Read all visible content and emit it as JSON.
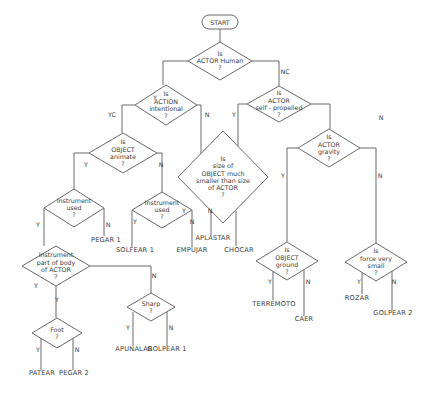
{
  "diagram": {
    "type": "decision-flowchart",
    "start": {
      "label": "START",
      "x": 220,
      "y": 22
    },
    "decisions": [
      {
        "id": "actor_human",
        "lines": [
          "Is",
          "ACTOR Human",
          "?"
        ],
        "cx": 220,
        "cy": 61,
        "hw": 32,
        "hh": 19
      },
      {
        "id": "action_intentional",
        "lines": [
          "Is",
          "ACTION",
          "intentional",
          "?"
        ],
        "cx": 166,
        "cy": 105,
        "hw": 31,
        "hh": 20
      },
      {
        "id": "actor_self_propelled",
        "lines": [
          "Is",
          "ACTOR",
          "self - propelled",
          "?"
        ],
        "cx": 279,
        "cy": 104,
        "hw": 32,
        "hh": 18
      },
      {
        "id": "object_animate",
        "lines": [
          "Is",
          "OBJECT",
          "animate",
          "?"
        ],
        "cx": 123,
        "cy": 153,
        "hw": 34,
        "hh": 20
      },
      {
        "id": "size_smaller",
        "lines": [
          "Is",
          "size of",
          "OBJECT much",
          "smaller than size",
          "of ACTOR",
          "?"
        ],
        "cx": 223,
        "cy": 177,
        "hw": 45,
        "hh": 46
      },
      {
        "id": "actor_gravity",
        "lines": [
          "Is",
          "ACTOR",
          "gravity",
          "?"
        ],
        "cx": 329,
        "cy": 148,
        "hw": 31,
        "hh": 19
      },
      {
        "id": "instrument_used_1",
        "lines": [
          "instrument",
          "used",
          "?"
        ],
        "cx": 74,
        "cy": 208,
        "hw": 30,
        "hh": 19
      },
      {
        "id": "instrument_used_2",
        "lines": [
          "instrument",
          "used",
          "?"
        ],
        "cx": 162,
        "cy": 210,
        "hw": 30,
        "hh": 18
      },
      {
        "id": "instrument_body",
        "lines": [
          "Instrument",
          "part of body",
          "of ACTOR",
          "?"
        ],
        "cx": 56,
        "cy": 266,
        "hw": 34,
        "hh": 20
      },
      {
        "id": "sharp",
        "lines": [
          "Sharp",
          "?"
        ],
        "cx": 151,
        "cy": 307,
        "hw": 24,
        "hh": 14
      },
      {
        "id": "foot",
        "lines": [
          "Foot",
          "?"
        ],
        "cx": 57,
        "cy": 333,
        "hw": 25,
        "hh": 15
      },
      {
        "id": "object_ground",
        "lines": [
          "Is",
          "OBJECT",
          "ground",
          "?"
        ],
        "cx": 287,
        "cy": 261,
        "hw": 31,
        "hh": 19
      },
      {
        "id": "force_small",
        "lines": [
          "Is",
          "force very",
          "small",
          "?"
        ],
        "cx": 376,
        "cy": 262,
        "hw": 31,
        "hh": 19
      }
    ],
    "branch_labels": [
      {
        "text": "Y",
        "x": 155,
        "y": 100
      },
      {
        "text": "NC",
        "x": 285,
        "y": 74
      },
      {
        "text": "YC",
        "x": 112,
        "y": 117
      },
      {
        "text": "N",
        "x": 207,
        "y": 117
      },
      {
        "text": "Y",
        "x": 234,
        "y": 117
      },
      {
        "text": "N",
        "x": 381,
        "y": 120
      },
      {
        "text": "Y",
        "x": 86,
        "y": 167
      },
      {
        "text": "N",
        "x": 161,
        "y": 167
      },
      {
        "text": "Y",
        "x": 184,
        "y": 213
      },
      {
        "text": "N",
        "x": 210,
        "y": 213
      },
      {
        "text": "Y",
        "x": 283,
        "y": 178
      },
      {
        "text": "N",
        "x": 380,
        "y": 178
      },
      {
        "text": "Y",
        "x": 38,
        "y": 227
      },
      {
        "text": "N",
        "x": 108,
        "y": 227
      },
      {
        "text": "Y",
        "x": 135,
        "y": 224
      },
      {
        "text": "N",
        "x": 192,
        "y": 224
      },
      {
        "text": "Y",
        "x": 36,
        "y": 288
      },
      {
        "text": "N",
        "x": 154,
        "y": 278
      },
      {
        "text": "Y",
        "x": 57,
        "y": 302
      },
      {
        "text": "Y",
        "x": 128,
        "y": 330
      },
      {
        "text": "N",
        "x": 171,
        "y": 330
      },
      {
        "text": "Y",
        "x": 38,
        "y": 352
      },
      {
        "text": "N",
        "x": 77,
        "y": 352
      },
      {
        "text": "Y",
        "x": 270,
        "y": 284
      },
      {
        "text": "N",
        "x": 308,
        "y": 284
      },
      {
        "text": "Y",
        "x": 359,
        "y": 284
      },
      {
        "text": "N",
        "x": 394,
        "y": 284
      }
    ],
    "outcomes": [
      {
        "text": "PATEAR",
        "x": 42,
        "y": 375
      },
      {
        "text": "PEGAR 2",
        "x": 74,
        "y": 375
      },
      {
        "text": "APUNALAR",
        "x": 134,
        "y": 351
      },
      {
        "text": "GOLPEAR 1",
        "x": 167,
        "y": 351
      },
      {
        "text": "PEGAR 1",
        "x": 106,
        "y": 242
      },
      {
        "text": "SOLFEAR 1",
        "x": 135,
        "y": 252
      },
      {
        "text": "EMPUJAR",
        "x": 192,
        "y": 252
      },
      {
        "text": "APLASTAR",
        "x": 213,
        "y": 240
      },
      {
        "text": "CHOCAR",
        "x": 239,
        "y": 252
      },
      {
        "text": "TERREMOTO",
        "x": 274,
        "y": 306
      },
      {
        "text": "CAER",
        "x": 304,
        "y": 321
      },
      {
        "text": "ROZAR",
        "x": 357,
        "y": 300
      },
      {
        "text": "GOLPEAR 2",
        "x": 393,
        "y": 315
      }
    ]
  }
}
